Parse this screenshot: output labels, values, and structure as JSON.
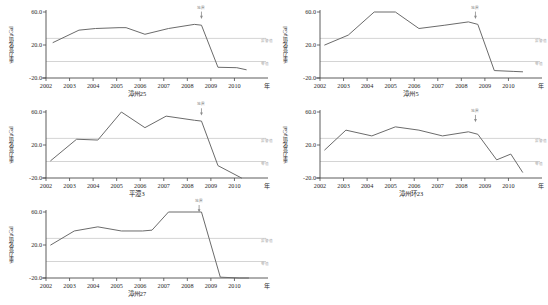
{
  "figure": {
    "width": 548,
    "height": 305,
    "background": "#ffffff",
    "series_color": "#6b6b6b",
    "axis_color": "#4a4a4a",
    "gridline_color": "#c9c9c9",
    "baseline_color": "#cfcfcf"
  },
  "axis": {
    "ylabel": "重力变化值/μGal",
    "xunit": "年",
    "yticks": [
      "60.0",
      "20.0",
      "-20.0"
    ],
    "ytick_values": [
      60,
      20,
      -20
    ],
    "ylim": [
      -20,
      60
    ],
    "xticks": [
      "2002",
      "2003",
      "2004",
      "2005",
      "2006",
      "2007",
      "2008",
      "2009",
      "2010"
    ],
    "xlim": [
      2002,
      2011
    ],
    "grid_labels": {
      "upper": "报警值",
      "lower": "零值"
    },
    "annotation": {
      "label": "地震",
      "arrow": "↓"
    }
  },
  "chart_data": [
    {
      "id": "zhangzhou-25",
      "type": "line",
      "title": "漳州25",
      "xlabel": "年",
      "ylabel": "重力变化值/μGal",
      "ylim": [
        -20,
        60
      ],
      "xlim": [
        2002,
        2011
      ],
      "grid": true,
      "legend": "none",
      "gridlines": [
        28,
        0
      ],
      "annotation": {
        "label": "地震",
        "x": 2008.6,
        "y": 52
      },
      "x": [
        2002.3,
        2003.4,
        2004.1,
        2005.1,
        2005.4,
        2006.2,
        2007.2,
        2008.3,
        2008.6,
        2009.3,
        2010.1,
        2010.5
      ],
      "y": [
        23.0,
        38.0,
        40.0,
        41.0,
        41.0,
        33.0,
        40.0,
        45.0,
        44.0,
        -7.0,
        -7.5,
        -10.0
      ]
    },
    {
      "id": "zhangzhou-5",
      "type": "line",
      "title": "漳州5",
      "xlabel": "年",
      "ylabel": "重力变化值/μGal",
      "ylim": [
        -20,
        60
      ],
      "xlim": [
        2002,
        2011
      ],
      "grid": true,
      "legend": "none",
      "gridlines": [
        28,
        0
      ],
      "annotation": {
        "label": "地震",
        "x": 2008.6,
        "y": 52
      },
      "x": [
        2002.2,
        2003.2,
        2004.3,
        2005.2,
        2006.2,
        2007.3,
        2008.3,
        2008.7,
        2009.4,
        2010.2,
        2010.6
      ],
      "y": [
        20.0,
        32.0,
        60.0,
        60.0,
        40.0,
        44.0,
        48.0,
        45.0,
        -11.0,
        -12.0,
        -12.5
      ]
    },
    {
      "id": "pingtan-3",
      "type": "line",
      "title": "平潭3",
      "xlabel": "年",
      "ylabel": "重力变化值/μGal",
      "ylim": [
        -20,
        60
      ],
      "xlim": [
        2002,
        2011
      ],
      "grid": true,
      "legend": "none",
      "gridlines": [
        28,
        0
      ],
      "annotation": {
        "label": "地震",
        "x": 2008.6,
        "y": 56
      },
      "x": [
        2002.2,
        2003.3,
        2004.2,
        2005.2,
        2006.2,
        2007.1,
        2008.3,
        2008.6,
        2009.3,
        2010.3
      ],
      "y": [
        1.0,
        27.0,
        26.0,
        60.0,
        41.0,
        55.0,
        50.0,
        49.0,
        -5.0,
        -20.0
      ]
    },
    {
      "id": "zhangzhou-huan-23",
      "type": "line",
      "title": "漳州环23",
      "xlabel": "年",
      "ylabel": "重力变化值/μGal",
      "ylim": [
        -20,
        60
      ],
      "xlim": [
        2002,
        2011
      ],
      "grid": true,
      "legend": "none",
      "gridlines": [
        28,
        0
      ],
      "annotation": {
        "label": "地震",
        "x": 2008.6,
        "y": 48
      },
      "x": [
        2002.2,
        2003.1,
        2004.2,
        2005.2,
        2006.2,
        2007.2,
        2008.3,
        2008.7,
        2009.5,
        2010.1,
        2010.6
      ],
      "y": [
        14.0,
        38.0,
        31.0,
        42.0,
        38.0,
        31.0,
        36.0,
        33.0,
        2.0,
        9.0,
        -13.0
      ]
    },
    {
      "id": "zhangzhou-27",
      "type": "line",
      "title": "漳州27",
      "xlabel": "年",
      "ylabel": "重力变化值/μGal",
      "ylim": [
        -20,
        60
      ],
      "xlim": [
        2002,
        2011
      ],
      "grid": true,
      "legend": "none",
      "gridlines": [
        28,
        0
      ],
      "annotation": {
        "label": "地震",
        "x": 2008.5,
        "y": 60
      },
      "x": [
        2002.2,
        2003.2,
        2004.2,
        2005.2,
        2006.1,
        2006.5,
        2007.2,
        2008.2,
        2008.6,
        2009.4,
        2010.2,
        2010.6
      ],
      "y": [
        20.0,
        37.0,
        42.0,
        37.0,
        37.0,
        38.0,
        60.0,
        60.0,
        60.0,
        -19.0,
        -20.0,
        -20.0
      ]
    }
  ],
  "panels": [
    {
      "chart": 0,
      "left": 0,
      "top": 0
    },
    {
      "chart": 1,
      "left": 274,
      "top": 0
    },
    {
      "chart": 2,
      "left": 0,
      "top": 100
    },
    {
      "chart": 3,
      "left": 274,
      "top": 100
    },
    {
      "chart": 4,
      "left": 0,
      "top": 200
    }
  ]
}
